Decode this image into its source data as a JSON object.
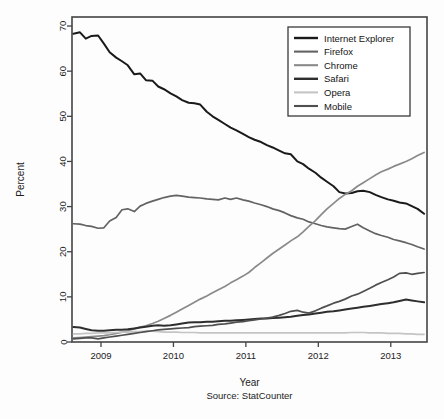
{
  "chart_data": {
    "type": "line",
    "title": "",
    "xlabel": "Year",
    "ylabel": "Percent",
    "caption": "Source: StatCounter",
    "source": "StatCounter",
    "xlim": [
      2008.6,
      2013.5
    ],
    "ylim": [
      0,
      72
    ],
    "yticks": [
      0,
      10,
      20,
      30,
      40,
      50,
      60,
      70
    ],
    "xticks": [
      2009,
      2010,
      2011,
      2012,
      2013
    ],
    "xtick_labels": [
      "2009",
      "2010",
      "2011",
      "2012",
      "2013"
    ],
    "grid": false,
    "legend_position": "top-right",
    "x": [
      2008.62,
      2008.71,
      2008.79,
      2008.87,
      2008.96,
      2009.04,
      2009.12,
      2009.21,
      2009.29,
      2009.37,
      2009.46,
      2009.54,
      2009.62,
      2009.71,
      2009.79,
      2009.87,
      2009.96,
      2010.04,
      2010.12,
      2010.21,
      2010.29,
      2010.37,
      2010.46,
      2010.54,
      2010.62,
      2010.71,
      2010.79,
      2010.87,
      2010.96,
      2011.04,
      2011.12,
      2011.21,
      2011.29,
      2011.37,
      2011.46,
      2011.54,
      2011.62,
      2011.71,
      2011.79,
      2011.87,
      2011.96,
      2012.04,
      2012.12,
      2012.21,
      2012.29,
      2012.37,
      2012.46,
      2012.54,
      2012.62,
      2012.71,
      2012.79,
      2012.87,
      2012.96,
      2013.04,
      2013.12,
      2013.21,
      2013.29,
      2013.37,
      2013.46
    ],
    "series": [
      {
        "name": "Internet Explorer",
        "color": "#1a1a1a",
        "width": 2.0,
        "values": [
          68.3,
          68.6,
          67.2,
          67.8,
          67.9,
          66.1,
          64.2,
          63.0,
          62.2,
          61.3,
          59.3,
          59.5,
          58.0,
          57.9,
          56.6,
          56.0,
          55.1,
          54.4,
          53.6,
          53.0,
          52.9,
          52.6,
          51.0,
          50.0,
          49.2,
          48.3,
          47.5,
          46.9,
          46.1,
          45.4,
          44.8,
          44.3,
          43.6,
          43.1,
          42.4,
          41.8,
          41.6,
          40.0,
          39.4,
          38.4,
          37.5,
          36.4,
          35.5,
          34.5,
          33.2,
          32.9,
          33.0,
          33.4,
          33.5,
          33.2,
          32.6,
          32.1,
          31.6,
          31.3,
          30.9,
          30.7,
          30.1,
          29.5,
          28.4
        ]
      },
      {
        "name": "Firefox",
        "color": "#636363",
        "width": 1.7,
        "values": [
          26.2,
          26.1,
          25.8,
          25.6,
          25.2,
          25.3,
          26.8,
          27.6,
          29.3,
          29.5,
          28.9,
          30.1,
          30.7,
          31.2,
          31.6,
          32.0,
          32.3,
          32.5,
          32.3,
          32.1,
          32.0,
          31.9,
          31.7,
          31.6,
          31.5,
          31.9,
          31.6,
          31.9,
          31.5,
          31.2,
          30.8,
          30.4,
          30.0,
          29.5,
          29.1,
          28.6,
          28.0,
          27.5,
          27.2,
          26.6,
          26.2,
          25.8,
          25.5,
          25.3,
          25.1,
          25.0,
          25.6,
          26.1,
          25.3,
          24.6,
          24.0,
          23.6,
          23.2,
          22.7,
          22.4,
          22.0,
          21.6,
          21.1,
          20.6
        ]
      },
      {
        "name": "Chrome",
        "color": "#8a8a8a",
        "width": 1.7,
        "values": [
          0.9,
          1.0,
          1.1,
          1.2,
          1.3,
          1.4,
          1.6,
          1.9,
          2.2,
          2.5,
          2.9,
          3.3,
          3.6,
          4.1,
          4.6,
          5.2,
          5.9,
          6.6,
          7.3,
          8.1,
          8.8,
          9.5,
          10.2,
          10.9,
          11.6,
          12.3,
          13.1,
          13.8,
          14.6,
          15.4,
          16.5,
          17.6,
          18.6,
          19.6,
          20.6,
          21.5,
          22.4,
          23.3,
          24.4,
          25.6,
          26.9,
          28.2,
          29.5,
          30.7,
          31.8,
          32.7,
          33.5,
          34.5,
          35.3,
          36.2,
          37.0,
          37.7,
          38.3,
          38.9,
          39.4,
          40.0,
          40.6,
          41.3,
          42.0
        ]
      },
      {
        "name": "Safari",
        "color": "#2e2e2e",
        "width": 2.0,
        "values": [
          3.3,
          3.2,
          2.9,
          2.6,
          2.5,
          2.5,
          2.6,
          2.7,
          2.7,
          2.8,
          3.0,
          3.2,
          3.4,
          3.6,
          3.7,
          3.6,
          3.7,
          3.9,
          4.1,
          4.3,
          4.4,
          4.4,
          4.5,
          4.5,
          4.6,
          4.7,
          4.7,
          4.8,
          4.9,
          5.0,
          5.1,
          5.2,
          5.2,
          5.3,
          5.4,
          5.5,
          5.6,
          5.8,
          6.0,
          6.1,
          6.3,
          6.5,
          6.7,
          6.8,
          7.0,
          7.2,
          7.4,
          7.6,
          7.8,
          8.0,
          8.2,
          8.4,
          8.6,
          8.8,
          9.1,
          9.4,
          9.2,
          9.0,
          8.8
        ]
      },
      {
        "name": "Opera",
        "color": "#c4c4c4",
        "width": 1.7,
        "values": [
          1.8,
          1.8,
          1.9,
          1.9,
          2.0,
          2.0,
          2.0,
          2.1,
          2.2,
          2.2,
          2.3,
          2.3,
          2.4,
          2.4,
          2.3,
          2.2,
          2.2,
          2.2,
          2.1,
          2.1,
          2.1,
          2.0,
          2.0,
          2.0,
          2.0,
          2.0,
          2.0,
          2.0,
          2.0,
          2.0,
          2.0,
          2.0,
          2.0,
          2.0,
          2.0,
          2.0,
          2.0,
          2.0,
          2.0,
          2.0,
          2.0,
          2.0,
          2.0,
          2.0,
          2.0,
          2.0,
          2.1,
          2.1,
          2.1,
          2.0,
          2.0,
          2.0,
          1.9,
          1.9,
          1.9,
          1.8,
          1.8,
          1.7,
          1.7
        ]
      },
      {
        "name": "Mobile",
        "color": "#4f4f4f",
        "width": 1.7,
        "values": [
          0.7,
          0.8,
          0.9,
          0.9,
          0.7,
          0.9,
          1.1,
          1.3,
          1.5,
          1.7,
          1.9,
          2.1,
          2.3,
          2.5,
          2.7,
          2.8,
          2.9,
          3.0,
          3.1,
          3.2,
          3.4,
          3.5,
          3.6,
          3.7,
          3.9,
          4.0,
          4.2,
          4.4,
          4.5,
          4.7,
          4.9,
          5.1,
          5.3,
          5.5,
          5.9,
          6.3,
          6.8,
          7.0,
          6.6,
          6.4,
          6.9,
          7.5,
          8.0,
          8.6,
          9.0,
          9.5,
          10.2,
          10.6,
          11.2,
          11.9,
          12.6,
          13.2,
          13.8,
          14.4,
          15.2,
          15.3,
          15.0,
          15.2,
          15.4
        ]
      }
    ]
  },
  "legend": {
    "entries": [
      {
        "label": "Internet Explorer"
      },
      {
        "label": "Firefox"
      },
      {
        "label": "Chrome"
      },
      {
        "label": "Safari"
      },
      {
        "label": "Opera"
      },
      {
        "label": "Mobile"
      }
    ]
  },
  "axes": {
    "y_title": "Percent",
    "x_title": "Year",
    "caption": "Source: StatCounter"
  },
  "colors": {
    "frame": "#444444",
    "text": "#1c1c1c",
    "background": "#fdfdfd"
  }
}
